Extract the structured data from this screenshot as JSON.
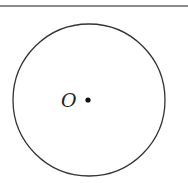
{
  "diagram": {
    "type": "geometry-figure",
    "circle": {
      "cx": 89,
      "cy": 100,
      "r": 76,
      "stroke": "#333333"
    },
    "center_point": {
      "label": "O",
      "cx": 88,
      "cy": 100,
      "r": 2.5,
      "fill": "#111111"
    },
    "top_rule_color": "#8a8a8a"
  }
}
